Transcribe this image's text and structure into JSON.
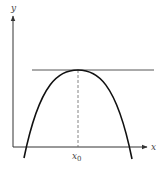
{
  "diagram": {
    "axes": {
      "x_label": "x",
      "y_label": "y"
    },
    "marker": {
      "label_main": "x",
      "label_sub": "0"
    },
    "colors": {
      "curve": "#111111",
      "axis": "#333333",
      "tangent": "#444444",
      "dashed": "#666666"
    }
  }
}
